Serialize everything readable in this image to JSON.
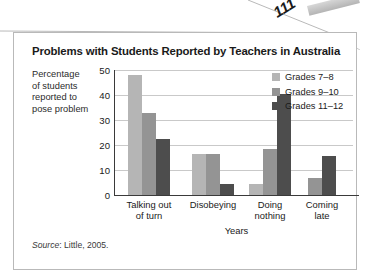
{
  "page": {
    "number": "111"
  },
  "figure": {
    "title": "Problems with Students Reported by Teachers in Australia",
    "y_caption_lines": [
      "Percentage",
      "of students",
      "reported to",
      "pose problem"
    ],
    "source_prefix": "Source",
    "source_text": ": Little, 2005."
  },
  "colors": {
    "grades_7_8": "#b5b5b5",
    "grades_9_10": "#949494",
    "grades_11_12": "#4d4d4d",
    "gridline": "#c9c9c9",
    "axis": "#3a3a3a",
    "frame": "#b9b9b9"
  },
  "chart_data": {
    "type": "bar",
    "title": "Problems with Students Reported by Teachers in Australia",
    "xlabel": "Years",
    "ylabel": "Percentage of students reported to pose problem",
    "categories": [
      "Talking out of turn",
      "Disobeying",
      "Doing nothing",
      "Coming late"
    ],
    "category_label_lines": [
      [
        "Talking out",
        "of turn"
      ],
      [
        "Disobeying",
        ""
      ],
      [
        "Doing",
        "nothing"
      ],
      [
        "Coming",
        "late"
      ]
    ],
    "series": [
      {
        "name": "Grades 7–8",
        "color": "#b5b5b5",
        "values": [
          48,
          16.5,
          4.5,
          0
        ]
      },
      {
        "name": "Grades 9–10",
        "color": "#949494",
        "values": [
          33,
          16.5,
          18.5,
          7
        ]
      },
      {
        "name": "Grades 11–12",
        "color": "#4d4d4d",
        "values": [
          22.5,
          4.5,
          40.5,
          15.5
        ]
      }
    ],
    "ylim": [
      0,
      50
    ],
    "yticks": [
      0,
      10,
      20,
      30,
      40,
      50
    ],
    "ytick_labels": [
      "0",
      "10",
      "20",
      "30",
      "40",
      "50"
    ],
    "grid": true,
    "legend_position": "top-right",
    "source": "Source: Little, 2005."
  }
}
